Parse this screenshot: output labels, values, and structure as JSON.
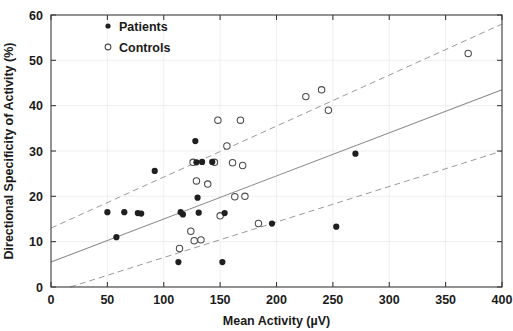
{
  "chart_data": {
    "type": "scatter",
    "title": "",
    "xlabel": "Mean Activity (µV)",
    "ylabel": "Directional Specificity of Activity (%)",
    "xlim": [
      0,
      400
    ],
    "ylim": [
      0,
      60
    ],
    "xticks": [
      0,
      50,
      100,
      150,
      200,
      250,
      300,
      350,
      400
    ],
    "yticks": [
      0,
      10,
      20,
      30,
      40,
      50,
      60
    ],
    "xtick_labels": [
      "0",
      "50",
      "100",
      "150",
      "200",
      "250",
      "300",
      "350",
      "400"
    ],
    "ytick_labels": [
      "0",
      "10",
      "20",
      "30",
      "40",
      "50",
      "60"
    ],
    "grid": false,
    "legend_position": "top-left",
    "series": [
      {
        "name": "Patients",
        "marker": "filled-circle",
        "color": "#1f1f1f",
        "points": [
          [
            50,
            16.5
          ],
          [
            58,
            11.0
          ],
          [
            65,
            16.5
          ],
          [
            77,
            16.3
          ],
          [
            80,
            16.2
          ],
          [
            92,
            25.6
          ],
          [
            113,
            5.5
          ],
          [
            115,
            16.5
          ],
          [
            117,
            16.0
          ],
          [
            128,
            32.2
          ],
          [
            130,
            19.7
          ],
          [
            131,
            16.4
          ],
          [
            129,
            27.5
          ],
          [
            134,
            27.6
          ],
          [
            143,
            27.6
          ],
          [
            152,
            5.5
          ],
          [
            154,
            16.3
          ],
          [
            196,
            14.0
          ],
          [
            253,
            13.3
          ],
          [
            270,
            29.4
          ]
        ]
      },
      {
        "name": "Controls",
        "marker": "open-circle",
        "color": "#4a4a4a",
        "points": [
          [
            114,
            8.5
          ],
          [
            124,
            12.3
          ],
          [
            126,
            27.5
          ],
          [
            127,
            10.2
          ],
          [
            129,
            23.4
          ],
          [
            133,
            10.4
          ],
          [
            139,
            22.7
          ],
          [
            145,
            27.5
          ],
          [
            148,
            36.8
          ],
          [
            150,
            15.7
          ],
          [
            156,
            31.1
          ],
          [
            161,
            27.4
          ],
          [
            163,
            19.9
          ],
          [
            168,
            36.8
          ],
          [
            170,
            26.8
          ],
          [
            172,
            20.0
          ],
          [
            184,
            14.0
          ],
          [
            226,
            42.0
          ],
          [
            240,
            43.5
          ],
          [
            246,
            39.0
          ],
          [
            370,
            51.5
          ]
        ]
      }
    ],
    "fit_line": {
      "label": "regression line",
      "style": "solid",
      "x": [
        0,
        400
      ],
      "y": [
        5.5,
        43.5
      ]
    },
    "confidence_bands": [
      {
        "label": "upper confidence band",
        "style": "dashed",
        "x": [
          0,
          400
        ],
        "y": [
          13.0,
          58.0
        ]
      },
      {
        "label": "lower confidence band",
        "style": "dashed",
        "x": [
          17,
          400
        ],
        "y": [
          0.0,
          30.0
        ]
      }
    ]
  },
  "legend": {
    "items": [
      {
        "label": "Patients",
        "marker": "filled-circle"
      },
      {
        "label": "Controls",
        "marker": "open-circle"
      }
    ]
  }
}
